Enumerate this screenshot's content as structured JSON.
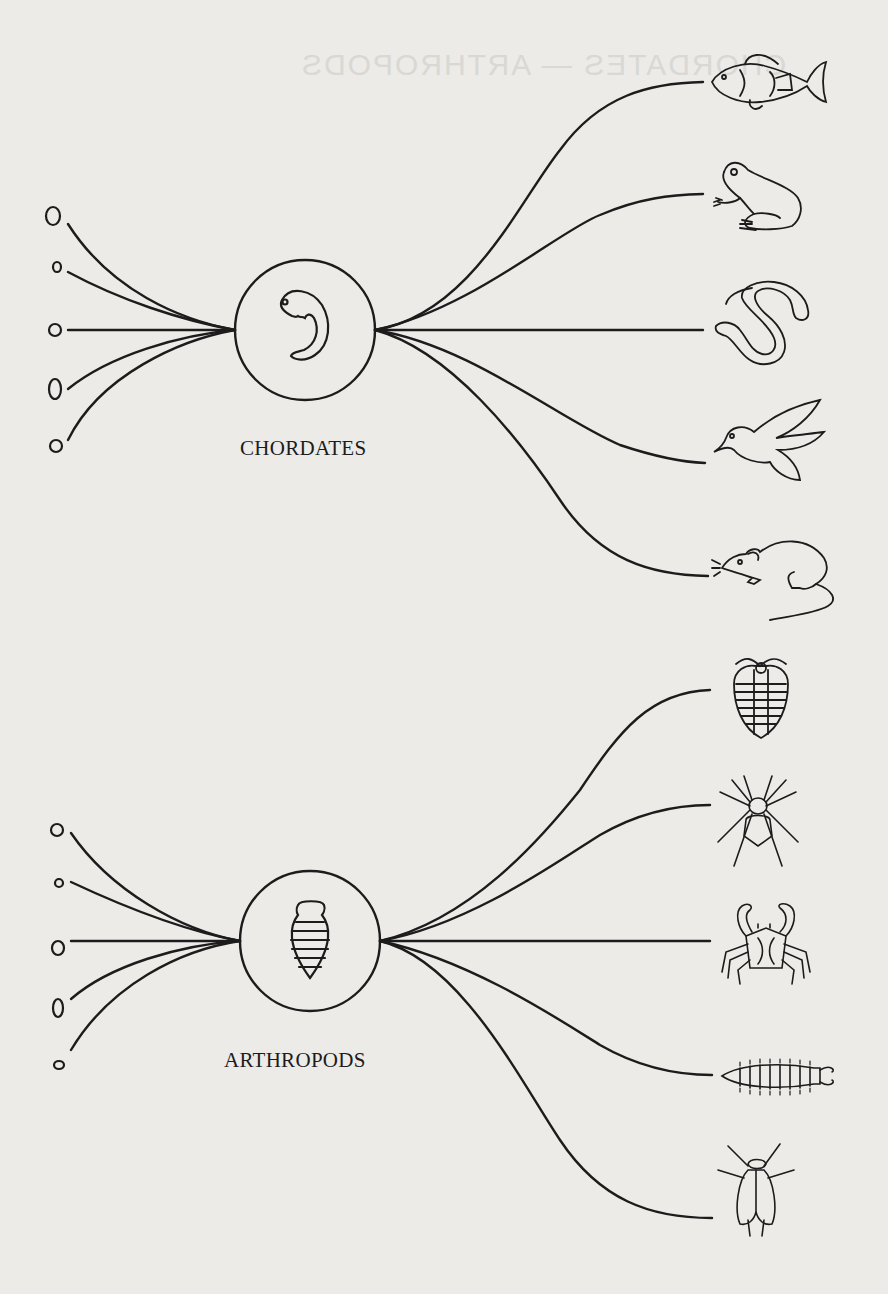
{
  "bleed_through": {
    "top_text": "CHORDATES — ARTHROPODS"
  },
  "groups": [
    {
      "id": "chordates",
      "label": "CHORDATES",
      "center_icon": "embryo-icon",
      "ancestors": 5,
      "descendants": [
        "fish",
        "frog",
        "snake",
        "bird",
        "rat"
      ]
    },
    {
      "id": "arthropods",
      "label": "ARTHROPODS",
      "center_icon": "segmented-larva-icon",
      "ancestors": 5,
      "descendants": [
        "trilobite",
        "spider",
        "crab",
        "millipede",
        "fly"
      ]
    }
  ],
  "colors": {
    "background": "#ecebe8",
    "ink": "#1c1c1c"
  }
}
